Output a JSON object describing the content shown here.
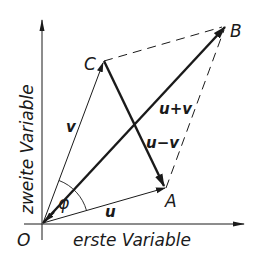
{
  "diagram": {
    "type": "vector-parallelogram",
    "axes": {
      "x_label": "erste Variable",
      "y_label": "zweite Variable",
      "origin_label": "O"
    },
    "points": {
      "O": {
        "label": "O",
        "x": 42,
        "y": 223
      },
      "A": {
        "label": "A",
        "x": 166,
        "y": 188
      },
      "B": {
        "label": "B",
        "x": 226,
        "y": 26
      },
      "C": {
        "label": "C",
        "x": 104,
        "y": 61
      }
    },
    "vectors": [
      {
        "name": "u",
        "label": "u",
        "from": "O",
        "to": "A",
        "style": "thin-arrow"
      },
      {
        "name": "v",
        "label": "v",
        "from": "O",
        "to": "C",
        "style": "thin-arrow"
      },
      {
        "name": "u+v",
        "label": "u+v",
        "from": "O",
        "to": "B",
        "style": "bold-arrow"
      },
      {
        "name": "u-v",
        "label": "u−v",
        "from": "C",
        "to": "A",
        "style": "bold-arrow"
      }
    ],
    "dashed_edges": [
      {
        "from": "C",
        "to": "B"
      },
      {
        "from": "A",
        "to": "B"
      }
    ],
    "angle": {
      "label": "φ",
      "between": [
        "u",
        "v"
      ],
      "at": "O"
    },
    "colors": {
      "ink": "#1a1a1a",
      "background": "#ffffff"
    }
  }
}
